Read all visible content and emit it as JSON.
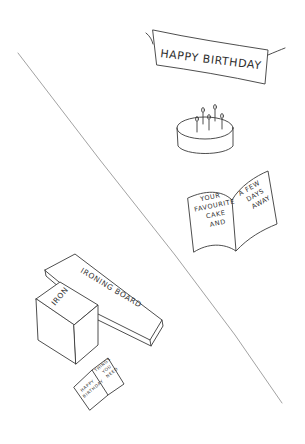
{
  "banner": {
    "text": "HAPPY BIRTHDAY"
  },
  "cake": {
    "candles": 5
  },
  "greeting_card": {
    "left_page": [
      "YOUR",
      "FAVOURITE",
      "CAKE",
      "AND"
    ],
    "right_page": [
      "A FEW",
      "DAYS",
      "AWAY"
    ]
  },
  "ironing_board": {
    "label": "IRONING BOARD"
  },
  "iron_box": {
    "label": "IRON"
  },
  "small_card": {
    "left_page": [
      "HAPPY",
      "BIRTHDAY"
    ],
    "right_page": [
      "THINGS",
      "YOU",
      "NEED"
    ]
  },
  "colors": {
    "ink": "#3a3a3a",
    "divider": "#8a8a8a",
    "background": "#ffffff"
  }
}
